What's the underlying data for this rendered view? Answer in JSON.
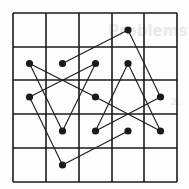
{
  "ghost_text": {
    "title": "Problems",
    "line1": "1.",
    "line2": "2."
  },
  "grid": {
    "cols": 5,
    "rows": 5,
    "x_lines": [
      13,
      46,
      79,
      112,
      144,
      177
    ],
    "y_lines": [
      13,
      47,
      80,
      114,
      148,
      182
    ],
    "line_color": "#1a1a1a"
  },
  "path": {
    "color": "#1a1a1a",
    "dot_radius": 3.6,
    "vertices": [
      {
        "col": 1,
        "row": 1
      },
      {
        "col": 3,
        "row": 0
      },
      {
        "col": 4,
        "row": 2
      },
      {
        "col": 2,
        "row": 3
      },
      {
        "col": 3,
        "row": 1
      },
      {
        "col": 4,
        "row": 3
      },
      {
        "col": 2,
        "row": 2
      },
      {
        "col": 0,
        "row": 1
      },
      {
        "col": 1,
        "row": 3
      },
      {
        "col": 2,
        "row": 1
      },
      {
        "col": 0,
        "row": 2
      },
      {
        "col": 1,
        "row": 4
      },
      {
        "col": 3,
        "row": 3
      }
    ]
  }
}
